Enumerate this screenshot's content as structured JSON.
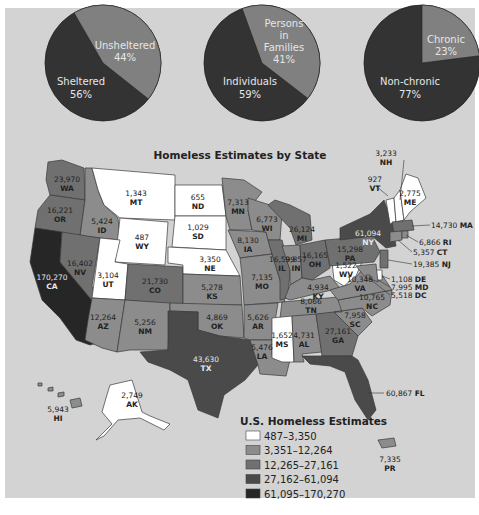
{
  "colors": {
    "background": "#d3d3d3",
    "bin1": "#ffffff",
    "bin2": "#8c8c8c",
    "bin3": "#707070",
    "bin4": "#4a4a4a",
    "bin5": "#262626",
    "pie_dark": "#333333",
    "pie_light": "#808080"
  },
  "chart_data": [
    {
      "type": "pie",
      "title": "",
      "slices": [
        {
          "label": "Sheltered",
          "value": 56
        },
        {
          "label": "Unsheltered",
          "value": 44
        }
      ]
    },
    {
      "type": "pie",
      "title": "",
      "slices": [
        {
          "label": "Individuals",
          "value": 59
        },
        {
          "label": "Persons in Families",
          "value": 41
        }
      ]
    },
    {
      "type": "pie",
      "title": "",
      "slices": [
        {
          "label": "Non-chronic",
          "value": 77
        },
        {
          "label": "Chronic",
          "value": 23
        }
      ]
    },
    {
      "type": "choropleth",
      "title": "Homeless Estimates by State",
      "legend_title": "U.S. Homeless Estimates",
      "bins": [
        "487–3,350",
        "3,351–12,264",
        "12,265–27,161",
        "27,162–61,094",
        "61,095–170,270"
      ],
      "values": {
        "WA": 23970,
        "OR": 16221,
        "CA": 170270,
        "ID": 5424,
        "NV": 16402,
        "MT": 1343,
        "WY": 487,
        "UT": 3104,
        "AZ": 12264,
        "CO": 21730,
        "NM": 5256,
        "ND": 655,
        "SD": 1029,
        "NE": 3350,
        "KS": 5278,
        "OK": 4869,
        "TX": 43630,
        "MN": 7313,
        "IA": 8130,
        "MO": 7135,
        "AR": 5626,
        "LA": 5476,
        "WI": 6773,
        "IL": 16599,
        "MI": 26124,
        "IN": 9857,
        "OH": 16165,
        "KY": 4934,
        "TN": 8066,
        "MS": 1652,
        "AL": 4731,
        "GA": 27161,
        "FL": 60867,
        "SC": 7958,
        "NC": 10765,
        "VA": 10348,
        "WV": 1522,
        "PA": 15298,
        "NY": 61094,
        "VT": 927,
        "NH": 3233,
        "ME": 2775,
        "MA": 14730,
        "RI": 6866,
        "CT": 5357,
        "NJ": 19385,
        "DE": 1108,
        "MD": 7995,
        "DC": 5518,
        "AK": 2749,
        "HI": 5943,
        "PR": 7335
      }
    }
  ],
  "pies": [
    {
      "dark_label": "Sheltered",
      "dark_pct": "56%",
      "light_label_lines": [
        "Unsheltered"
      ],
      "light_pct": "44%"
    },
    {
      "dark_label": "Individuals",
      "dark_pct": "59%",
      "light_label_lines": [
        "Persons",
        "in",
        "Families"
      ],
      "light_pct": "41%"
    },
    {
      "dark_label": "Non-chronic",
      "dark_pct": "77%",
      "light_label_lines": [
        "Chronic"
      ],
      "light_pct": "23%"
    }
  ],
  "map": {
    "title": "Homeless Estimates by State",
    "labels": {
      "WA": {
        "num": "23,970",
        "code": "WA"
      },
      "OR": {
        "num": "16,221",
        "code": "OR"
      },
      "CA": {
        "num": "170,270",
        "code": "CA"
      },
      "ID": {
        "num": "5,424",
        "code": "ID"
      },
      "NV": {
        "num": "16,402",
        "code": "NV"
      },
      "MT": {
        "num": "1,343",
        "code": "MT"
      },
      "WY": {
        "num": "487",
        "code": "WY"
      },
      "UT": {
        "num": "3,104",
        "code": "UT"
      },
      "AZ": {
        "num": "12,264",
        "code": "AZ"
      },
      "CO": {
        "num": "21,730",
        "code": "CO"
      },
      "NM": {
        "num": "5,256",
        "code": "NM"
      },
      "ND": {
        "num": "655",
        "code": "ND"
      },
      "SD": {
        "num": "1,029",
        "code": "SD"
      },
      "NE": {
        "num": "3,350",
        "code": "NE"
      },
      "KS": {
        "num": "5,278",
        "code": "KS"
      },
      "OK": {
        "num": "4,869",
        "code": "OK"
      },
      "TX": {
        "num": "43,630",
        "code": "TX"
      },
      "MN": {
        "num": "7,313",
        "code": "MN"
      },
      "IA": {
        "num": "8,130",
        "code": "IA"
      },
      "MO": {
        "num": "7,135",
        "code": "MO"
      },
      "AR": {
        "num": "5,626",
        "code": "AR"
      },
      "LA": {
        "num": "5,476",
        "code": "LA"
      },
      "WI": {
        "num": "6,773",
        "code": "WI"
      },
      "IL": {
        "num": "16,599",
        "code": "IL"
      },
      "MI": {
        "num": "26,124",
        "code": "MI"
      },
      "IN": {
        "num": "9,857",
        "code": "IN"
      },
      "OH": {
        "num": "16,165",
        "code": "OH"
      },
      "KY": {
        "num": "4,934",
        "code": "KY"
      },
      "TN": {
        "num": "8,066",
        "code": "TN"
      },
      "MS": {
        "num": "1,652",
        "code": "MS"
      },
      "AL": {
        "num": "4,731",
        "code": "AL"
      },
      "GA": {
        "num": "27,161",
        "code": "GA"
      },
      "SC": {
        "num": "7,958",
        "code": "SC"
      },
      "NC": {
        "num": "10,765",
        "code": "NC"
      },
      "VA": {
        "num": "10,348",
        "code": "VA"
      },
      "WV": {
        "num": "1,522",
        "code": "WV"
      },
      "PA": {
        "num": "15,298",
        "code": "PA"
      },
      "NY": {
        "num": "61,094",
        "code": "NY"
      },
      "VT": {
        "num": "927",
        "code": "VT"
      },
      "NH": {
        "num": "3,233",
        "code": "NH"
      },
      "ME": {
        "num": "2,775",
        "code": "ME"
      },
      "AK": {
        "num": "2,749",
        "code": "AK"
      },
      "HI": {
        "num": "5,943",
        "code": "HI"
      },
      "PR": {
        "num": "7,335",
        "code": "PR"
      }
    },
    "callouts": {
      "MA": {
        "num": "14,730",
        "code": "MA"
      },
      "RI": {
        "num": "6,866",
        "code": "RI"
      },
      "CT": {
        "num": "5,357",
        "code": "CT"
      },
      "NJ": {
        "num": "19,385",
        "code": "NJ"
      },
      "DE": {
        "num": "1,108",
        "code": "DE"
      },
      "MD": {
        "num": "7,995",
        "code": "MD"
      },
      "DC": {
        "num": "5,518",
        "code": "DC"
      },
      "FL": {
        "num": "60,867",
        "code": "FL"
      }
    }
  },
  "legend": {
    "title": "U.S. Homeless Estimates",
    "items": [
      "487–3,350",
      "3,351–12,264",
      "12,265–27,161",
      "27,162–61,094",
      "61,095–170,270"
    ]
  }
}
